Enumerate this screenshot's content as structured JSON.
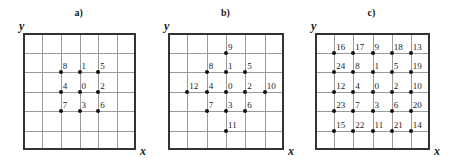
{
  "panels": [
    {
      "id": "a",
      "title": "a)",
      "x_label": "x",
      "y_label": "y",
      "left": 23,
      "right": 136,
      "top": 33,
      "bottom": 150,
      "grid_divisions": 6,
      "points": [
        {
          "label": "8",
          "col": 2,
          "row": 2
        },
        {
          "label": "1",
          "col": 3,
          "row": 2
        },
        {
          "label": "5",
          "col": 4,
          "row": 2
        },
        {
          "label": "4",
          "col": 2,
          "row": 3
        },
        {
          "label": "0",
          "col": 3,
          "row": 3
        },
        {
          "label": "2",
          "col": 4,
          "row": 3
        },
        {
          "label": "7",
          "col": 2,
          "row": 4
        },
        {
          "label": "3",
          "col": 3,
          "row": 4
        },
        {
          "label": "6",
          "col": 4,
          "row": 4
        }
      ]
    },
    {
      "id": "b",
      "title": "b)",
      "x_label": "x",
      "y_label": "y",
      "left": 168,
      "right": 284,
      "top": 33,
      "bottom": 150,
      "grid_divisions": 6,
      "points": [
        {
          "label": "9",
          "col": 3,
          "row": 1
        },
        {
          "label": "8",
          "col": 2,
          "row": 2
        },
        {
          "label": "1",
          "col": 3,
          "row": 2
        },
        {
          "label": "5",
          "col": 4,
          "row": 2
        },
        {
          "label": "12",
          "col": 1,
          "row": 3
        },
        {
          "label": "4",
          "col": 2,
          "row": 3
        },
        {
          "label": "0",
          "col": 3,
          "row": 3
        },
        {
          "label": "2",
          "col": 4,
          "row": 3
        },
        {
          "label": "10",
          "col": 5,
          "row": 3
        },
        {
          "label": "7",
          "col": 2,
          "row": 4
        },
        {
          "label": "3",
          "col": 3,
          "row": 4
        },
        {
          "label": "6",
          "col": 4,
          "row": 4
        },
        {
          "label": "11",
          "col": 3,
          "row": 5
        }
      ]
    },
    {
      "id": "c",
      "title": "c)",
      "x_label": "x",
      "y_label": "y",
      "left": 315,
      "right": 430,
      "top": 33,
      "bottom": 150,
      "grid_divisions": 6,
      "points": [
        {
          "label": "16",
          "col": 1,
          "row": 1
        },
        {
          "label": "17",
          "col": 2,
          "row": 1
        },
        {
          "label": "9",
          "col": 3,
          "row": 1
        },
        {
          "label": "18",
          "col": 4,
          "row": 1
        },
        {
          "label": "13",
          "col": 5,
          "row": 1
        },
        {
          "label": "24",
          "col": 1,
          "row": 2
        },
        {
          "label": "8",
          "col": 2,
          "row": 2
        },
        {
          "label": "1",
          "col": 3,
          "row": 2
        },
        {
          "label": "5",
          "col": 4,
          "row": 2
        },
        {
          "label": "19",
          "col": 5,
          "row": 2
        },
        {
          "label": "12",
          "col": 1,
          "row": 3
        },
        {
          "label": "4",
          "col": 2,
          "row": 3
        },
        {
          "label": "0",
          "col": 3,
          "row": 3
        },
        {
          "label": "2",
          "col": 4,
          "row": 3
        },
        {
          "label": "10",
          "col": 5,
          "row": 3
        },
        {
          "label": "23",
          "col": 1,
          "row": 4
        },
        {
          "label": "7",
          "col": 2,
          "row": 4
        },
        {
          "label": "3",
          "col": 3,
          "row": 4
        },
        {
          "label": "6",
          "col": 4,
          "row": 4
        },
        {
          "label": "20",
          "col": 5,
          "row": 4
        },
        {
          "label": "15",
          "col": 1,
          "row": 5
        },
        {
          "label": "22",
          "col": 2,
          "row": 5
        },
        {
          "label": "11",
          "col": 3,
          "row": 5
        },
        {
          "label": "21",
          "col": 4,
          "row": 5
        },
        {
          "label": "14",
          "col": 5,
          "row": 5
        }
      ]
    }
  ]
}
